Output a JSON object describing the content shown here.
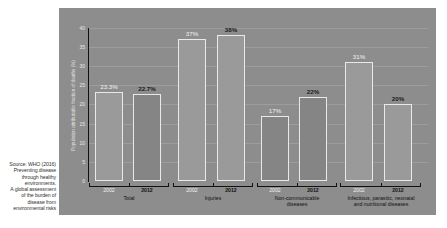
{
  "source_note": "Source: WHO (2016) Preventing disease through healthy environments. A global assessment of the burden of disease from environmental risks",
  "source_lines": [
    "Source: WHO (2016)",
    "Preventing disease",
    "through healthy",
    "environments.",
    "A global assessment",
    "of the burden of",
    "disease from",
    "environmental risks"
  ],
  "colors": {
    "panel_background": "#8d8d8d",
    "bar_outline": "#e9e9e9",
    "bar_fill_light": "#9a9a9a",
    "bar_fill_dark": "#858585",
    "label_2002": "#f2f2f2",
    "label_2012": "#1a1a1a"
  },
  "chart_data": {
    "type": "bar",
    "title": "",
    "xlabel": "",
    "ylabel": "Population attributable fraction of deaths (%)",
    "ylim": [
      0,
      40
    ],
    "yticks": [
      "0",
      "5",
      "10",
      "15",
      "20",
      "25",
      "30",
      "35",
      "40"
    ],
    "grid": true,
    "legend": null,
    "categories": [
      "Total",
      "Injuries",
      "Non-communicable diseases",
      "Infectious, parasitic, neonatal and nutritional diseases"
    ],
    "category_label_lines": [
      [
        "Total"
      ],
      [
        "Injuries"
      ],
      [
        "Non-communicable",
        "diseases"
      ],
      [
        "Infectious, parasitic, neonatal",
        "and nutritional diseases"
      ]
    ],
    "series": [
      {
        "name": "2002",
        "values": [
          23.3,
          37,
          17,
          31
        ],
        "labels": [
          "23.3%",
          "37%",
          "17%",
          "31%"
        ]
      },
      {
        "name": "2012",
        "values": [
          22.7,
          38,
          22,
          20
        ],
        "labels": [
          "22.7%",
          "38%",
          "22%",
          "20%"
        ]
      }
    ]
  }
}
